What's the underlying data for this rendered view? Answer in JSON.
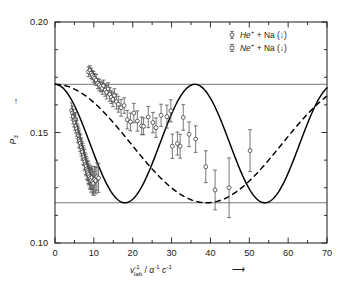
{
  "figure": {
    "background_color": "#ffffff",
    "frame_color": "#1a1a1a"
  },
  "axes": {
    "y_title_main": "P",
    "y_title_sub": "3",
    "y_arrow": "↑",
    "x_title_var": "v",
    "x_title_var_sup": "-1",
    "x_title_var_sub": "lab",
    "x_title_units": " / α",
    "x_title_units_sup1": "-1",
    "x_title_units_mid": " c",
    "x_title_units_sup2": "-1",
    "x_arrow": "⟶",
    "x_ticklabels": [
      "0",
      "10",
      "20",
      "30",
      "40",
      "50",
      "60",
      "70"
    ],
    "y_ticklabels": [
      "0.10",
      "0.15",
      "0.20"
    ]
  },
  "legend": {
    "position": "top-right",
    "entries": [
      {
        "marker": "open-circle-with-errorbar",
        "species": "He",
        "charge": "+",
        "target": " + Na (",
        "arrow": "↓",
        "close": ")"
      },
      {
        "marker": "open-circle-with-errorbar",
        "species": "Ne",
        "charge": "+",
        "target": " + Na (",
        "arrow": "↓",
        "close": ")"
      }
    ]
  },
  "chart_data": {
    "type": "scatter",
    "title": "",
    "xlabel": "v_lab^-1 / alpha^-1 c^-1",
    "ylabel": "P_3",
    "xlim": [
      0,
      70
    ],
    "ylim": [
      0.1,
      0.2
    ],
    "grid": false,
    "x_major_ticks": [
      0,
      10,
      20,
      30,
      40,
      50,
      60,
      70
    ],
    "x_minor_step": 5,
    "y_major_ticks": [
      0.1,
      0.15,
      0.2
    ],
    "y_minor_step": 0.0125,
    "reference_lines": [
      {
        "name": "upper-limit",
        "y": 0.1718,
        "style": "solid",
        "color": "#555555"
      },
      {
        "name": "lower-limit",
        "y": 0.1182,
        "style": "solid",
        "color": "#555555"
      }
    ],
    "series": [
      {
        "name": "Ne+ + Na",
        "marker": "open-circle",
        "errorbars": true,
        "points": [
          {
            "x": 4.3,
            "y": 0.16,
            "err": 0.0034
          },
          {
            "x": 4.5,
            "y": 0.1588,
            "err": 0.0032
          },
          {
            "x": 4.7,
            "y": 0.1572,
            "err": 0.0033
          },
          {
            "x": 4.9,
            "y": 0.1556,
            "err": 0.0031
          },
          {
            "x": 5.1,
            "y": 0.1545,
            "err": 0.0034
          },
          {
            "x": 5.3,
            "y": 0.156,
            "err": 0.003
          },
          {
            "x": 5.4,
            "y": 0.153,
            "err": 0.0032
          },
          {
            "x": 5.6,
            "y": 0.1518,
            "err": 0.0035
          },
          {
            "x": 5.8,
            "y": 0.1505,
            "err": 0.0033
          },
          {
            "x": 5.9,
            "y": 0.1492,
            "err": 0.0036
          },
          {
            "x": 6.1,
            "y": 0.1486,
            "err": 0.0034
          },
          {
            "x": 6.2,
            "y": 0.147,
            "err": 0.0037
          },
          {
            "x": 6.4,
            "y": 0.1462,
            "err": 0.0035
          },
          {
            "x": 6.5,
            "y": 0.1452,
            "err": 0.0038
          },
          {
            "x": 6.7,
            "y": 0.144,
            "err": 0.0036
          },
          {
            "x": 6.8,
            "y": 0.1432,
            "err": 0.0039
          },
          {
            "x": 7.0,
            "y": 0.142,
            "err": 0.004
          },
          {
            "x": 7.1,
            "y": 0.1412,
            "err": 0.0038
          },
          {
            "x": 7.3,
            "y": 0.1398,
            "err": 0.0042
          },
          {
            "x": 7.4,
            "y": 0.139,
            "err": 0.004
          },
          {
            "x": 7.6,
            "y": 0.1378,
            "err": 0.0044
          },
          {
            "x": 7.7,
            "y": 0.1368,
            "err": 0.0042
          },
          {
            "x": 7.9,
            "y": 0.1356,
            "err": 0.0046
          },
          {
            "x": 8.0,
            "y": 0.1348,
            "err": 0.0044
          },
          {
            "x": 8.2,
            "y": 0.1336,
            "err": 0.0048
          },
          {
            "x": 8.4,
            "y": 0.1328,
            "err": 0.0046
          },
          {
            "x": 8.5,
            "y": 0.1318,
            "err": 0.005
          },
          {
            "x": 8.7,
            "y": 0.131,
            "err": 0.0048
          },
          {
            "x": 8.9,
            "y": 0.13,
            "err": 0.0052
          },
          {
            "x": 9.1,
            "y": 0.1292,
            "err": 0.005
          },
          {
            "x": 9.3,
            "y": 0.1284,
            "err": 0.0054
          },
          {
            "x": 9.5,
            "y": 0.1296,
            "err": 0.0052
          },
          {
            "x": 9.7,
            "y": 0.1278,
            "err": 0.0056
          },
          {
            "x": 9.9,
            "y": 0.127,
            "err": 0.0055
          },
          {
            "x": 10.2,
            "y": 0.1288,
            "err": 0.0058
          },
          {
            "x": 10.5,
            "y": 0.1282,
            "err": 0.006
          },
          {
            "x": 10.8,
            "y": 0.13,
            "err": 0.0062
          },
          {
            "x": 11.2,
            "y": 0.1294,
            "err": 0.0065
          }
        ]
      },
      {
        "name": "He+ + Na",
        "marker": "open-circle",
        "errorbars": true,
        "points": [
          {
            "x": 8.6,
            "y": 0.1775,
            "err": 0.0022
          },
          {
            "x": 9.0,
            "y": 0.1782,
            "err": 0.002
          },
          {
            "x": 9.3,
            "y": 0.1768,
            "err": 0.0023
          },
          {
            "x": 9.6,
            "y": 0.176,
            "err": 0.0021
          },
          {
            "x": 9.9,
            "y": 0.1752,
            "err": 0.0024
          },
          {
            "x": 10.2,
            "y": 0.1745,
            "err": 0.0022
          },
          {
            "x": 10.6,
            "y": 0.1738,
            "err": 0.0025
          },
          {
            "x": 11.0,
            "y": 0.1722,
            "err": 0.0023
          },
          {
            "x": 11.4,
            "y": 0.1715,
            "err": 0.0026
          },
          {
            "x": 11.8,
            "y": 0.1708,
            "err": 0.0024
          },
          {
            "x": 12.2,
            "y": 0.17,
            "err": 0.0027
          },
          {
            "x": 12.5,
            "y": 0.1712,
            "err": 0.0025
          },
          {
            "x": 12.9,
            "y": 0.1692,
            "err": 0.0028
          },
          {
            "x": 13.3,
            "y": 0.1682,
            "err": 0.003
          },
          {
            "x": 13.7,
            "y": 0.1698,
            "err": 0.0027
          },
          {
            "x": 14.1,
            "y": 0.1672,
            "err": 0.0031
          },
          {
            "x": 14.5,
            "y": 0.166,
            "err": 0.0029
          },
          {
            "x": 14.9,
            "y": 0.165,
            "err": 0.0033
          },
          {
            "x": 15.3,
            "y": 0.1668,
            "err": 0.003
          },
          {
            "x": 15.8,
            "y": 0.164,
            "err": 0.0034
          },
          {
            "x": 16.3,
            "y": 0.1628,
            "err": 0.0036
          },
          {
            "x": 17.0,
            "y": 0.1612,
            "err": 0.0038
          },
          {
            "x": 17.8,
            "y": 0.1622,
            "err": 0.0035
          },
          {
            "x": 18.6,
            "y": 0.1558,
            "err": 0.0042
          },
          {
            "x": 19.4,
            "y": 0.1548,
            "err": 0.004
          },
          {
            "x": 20.3,
            "y": 0.1588,
            "err": 0.0044
          },
          {
            "x": 21.2,
            "y": 0.1552,
            "err": 0.0046
          },
          {
            "x": 22.3,
            "y": 0.153,
            "err": 0.004
          },
          {
            "x": 22.8,
            "y": 0.1528,
            "err": 0.0038
          },
          {
            "x": 24.0,
            "y": 0.157,
            "err": 0.0048
          },
          {
            "x": 25.2,
            "y": 0.1545,
            "err": 0.0046
          },
          {
            "x": 26.0,
            "y": 0.1522,
            "err": 0.0044
          },
          {
            "x": 27.3,
            "y": 0.1578,
            "err": 0.005
          },
          {
            "x": 28.8,
            "y": 0.1572,
            "err": 0.0052
          },
          {
            "x": 29.8,
            "y": 0.1598,
            "err": 0.005
          },
          {
            "x": 30.2,
            "y": 0.1438,
            "err": 0.0055
          },
          {
            "x": 31.5,
            "y": 0.145,
            "err": 0.0052
          },
          {
            "x": 32.2,
            "y": 0.1438,
            "err": 0.0054
          },
          {
            "x": 33.0,
            "y": 0.1568,
            "err": 0.0058
          },
          {
            "x": 34.5,
            "y": 0.1492,
            "err": 0.0056
          },
          {
            "x": 36.2,
            "y": 0.147,
            "err": 0.006
          },
          {
            "x": 38.8,
            "y": 0.1345,
            "err": 0.0072
          },
          {
            "x": 41.2,
            "y": 0.124,
            "err": 0.009
          },
          {
            "x": 44.8,
            "y": 0.125,
            "err": 0.0135
          },
          {
            "x": 50.2,
            "y": 0.1418,
            "err": 0.0095
          }
        ]
      }
    ],
    "curves": [
      {
        "name": "solid-theory-curve",
        "style": "solid",
        "description": "Damped-free oscillation between 0.1182 and 0.1718, period ~36 units, starts at upper limit at x=0, first minimum at x~17.5, maximum at x~36, second minimum at x~53.5, returns to upper limit at x=70",
        "amplitude_max": 0.1718,
        "amplitude_min": 0.1182,
        "period": 36,
        "phase_x0_value": 0.1718
      },
      {
        "name": "dashed-theory-curve",
        "style": "dashed",
        "description": "Slower oscillation between 0.1182 and 0.1718, period ~78 units, starts at upper limit at x=0, minimum near x~39, rising to ~0.166 at x=70",
        "amplitude_max": 0.1718,
        "amplitude_min": 0.1182,
        "period": 78,
        "phase_x0_value": 0.1718
      }
    ]
  }
}
